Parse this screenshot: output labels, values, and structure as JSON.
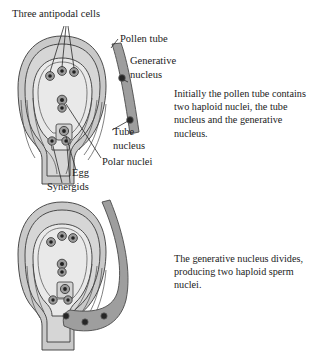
{
  "figure": {
    "background_color": "#ffffff",
    "text_color": "#1b1b1b"
  },
  "colors": {
    "integument_outer": "#c9c9c9",
    "integument_mid": "#d6d6d6",
    "embryo_sac": "#e4e4e4",
    "embryo_sac_inner": "#ededed",
    "pollen_tube_fill": "#9e9e9e",
    "pollen_tube_stroke": "#4a4a4a",
    "nucleus_fill": "#2b2b2b",
    "nucleus_ring": "#8a8a8a",
    "outline_stroke": "#3a3a3a",
    "leader_stroke": "#2a2a2a"
  },
  "labels": [
    {
      "id": "three-antipodal-cells",
      "text": "Three antipodal cells",
      "x": 12,
      "y": 17
    },
    {
      "id": "pollen-tube",
      "text": "Pollen tube",
      "x": 120,
      "y": 42
    },
    {
      "id": "generative-nucleus-line1",
      "text": "Generative",
      "x": 130,
      "y": 64
    },
    {
      "id": "generative-nucleus-line2",
      "text": "nucleus",
      "x": 130,
      "y": 78
    },
    {
      "id": "tube-nucleus-line1",
      "text": "Tube",
      "x": 113,
      "y": 135
    },
    {
      "id": "tube-nucleus-line2",
      "text": "nucleus",
      "x": 113,
      "y": 149
    },
    {
      "id": "polar-nuclei",
      "text": "Polar nuclei",
      "x": 102,
      "y": 165
    },
    {
      "id": "egg",
      "text": "Egg",
      "x": 72,
      "y": 176
    },
    {
      "id": "synergids",
      "text": "Synergids",
      "x": 47,
      "y": 190
    }
  ],
  "paragraphs": [
    {
      "id": "paragraph-top",
      "x": 174,
      "y": 97,
      "line_height": 13.2,
      "lines": [
        "Initially the pollen tube contains",
        "two haploid nuclei, the tube",
        "nucleus and the generative",
        "nucleus."
      ]
    },
    {
      "id": "paragraph-bottom",
      "x": 174,
      "y": 262,
      "line_height": 13.2,
      "lines": [
        "The generative nucleus divides,",
        "producing two haploid sperm",
        "nuclei."
      ]
    }
  ],
  "diagram_top": {
    "name": "ovule-with-pollen-tube-stage-1",
    "structures": [
      {
        "id": "antipodal-cell-1",
        "cx": 50,
        "cy": 76,
        "r": 4.2
      },
      {
        "id": "antipodal-cell-2",
        "cx": 62,
        "cy": 71,
        "r": 4.2
      },
      {
        "id": "antipodal-cell-3",
        "cx": 74,
        "cy": 72,
        "r": 4.2
      },
      {
        "id": "polar-nucleus-1",
        "cx": 62,
        "cy": 100,
        "r": 4.6
      },
      {
        "id": "polar-nucleus-2",
        "cx": 62,
        "cy": 108,
        "r": 4.0
      },
      {
        "id": "egg-cell",
        "cx": 64,
        "cy": 131,
        "r": 5.0
      },
      {
        "id": "synergid-1",
        "cx": 52,
        "cy": 141,
        "r": 4.2
      },
      {
        "id": "synergid-2",
        "cx": 66,
        "cy": 141,
        "r": 4.2
      },
      {
        "id": "generative-nucleus",
        "cx": 122,
        "cy": 78,
        "r": 3.4
      },
      {
        "id": "tube-nucleus",
        "cx": 128,
        "cy": 117,
        "r": 3.4
      }
    ]
  },
  "diagram_bottom": {
    "name": "ovule-with-pollen-tube-stage-2",
    "structures": [
      {
        "id": "antipodal-cell-1",
        "cx": 51,
        "cy": 242,
        "r": 4.2
      },
      {
        "id": "antipodal-cell-2",
        "cx": 62,
        "cy": 236,
        "r": 4.2
      },
      {
        "id": "antipodal-cell-3",
        "cx": 73,
        "cy": 238,
        "r": 4.2
      },
      {
        "id": "polar-nucleus-1",
        "cx": 62,
        "cy": 264,
        "r": 4.6
      },
      {
        "id": "polar-nucleus-2",
        "cx": 62,
        "cy": 272,
        "r": 4.0
      },
      {
        "id": "egg-cell",
        "cx": 65,
        "cy": 289,
        "r": 5.0
      },
      {
        "id": "synergid-1",
        "cx": 53,
        "cy": 300,
        "r": 4.2
      },
      {
        "id": "synergid-2",
        "cx": 68,
        "cy": 300,
        "r": 4.2
      },
      {
        "id": "sperm-nucleus-1",
        "cx": 66,
        "cy": 313,
        "r": 3.2
      },
      {
        "id": "sperm-nucleus-2",
        "cx": 84,
        "cy": 318,
        "r": 3.2
      },
      {
        "id": "tube-nucleus",
        "cx": 100,
        "cy": 317,
        "r": 3.2
      }
    ]
  }
}
